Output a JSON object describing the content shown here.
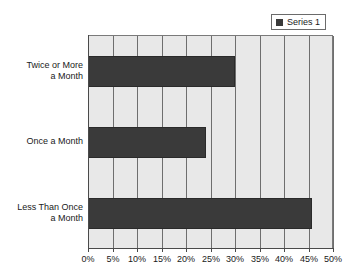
{
  "chart_data": {
    "type": "bar",
    "orientation": "horizontal",
    "title": "",
    "xlabel": "",
    "ylabel": "",
    "categories": [
      "Twice or More a Month",
      "Once a Month",
      "Less Than Once a Month"
    ],
    "category_lines": [
      [
        "Twice or More",
        "a Month"
      ],
      [
        "Once a Month"
      ],
      [
        "Less Than Once",
        "a Month"
      ]
    ],
    "values": [
      30,
      24,
      45.7
    ],
    "series": [
      {
        "name": "Series 1",
        "values": [
          30,
          24,
          45.7
        ]
      }
    ],
    "xlim": [
      0,
      50
    ],
    "xticks": [
      0,
      5,
      10,
      15,
      20,
      25,
      30,
      35,
      40,
      45,
      50
    ],
    "xtick_labels": [
      "0%",
      "5%",
      "10%",
      "15%",
      "20%",
      "25%",
      "30%",
      "35%",
      "40%",
      "45%",
      "50%"
    ],
    "grid": true,
    "grid_axis": "x",
    "legend_position": "top-right",
    "colors": {
      "bar": "#3a3a3a",
      "plot_background": "#e8e8e8",
      "gridline": "#6e6e6e",
      "axis": "#4a4a4a",
      "text": "#1a1a1a",
      "page_background": "#ffffff"
    }
  },
  "legend": {
    "entries": [
      {
        "label": "Series 1",
        "swatch_color": "#3a3a3a"
      }
    ]
  }
}
